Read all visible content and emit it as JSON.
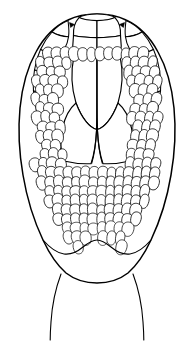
{
  "figure": {
    "title": "Ventral view of reptile head scalation",
    "caption": "",
    "view": "ventral",
    "subject": "reptile head",
    "style": "black ink line drawing",
    "background_color": "#ffffff",
    "line_color": "#000000",
    "fill_color": "#ffffff",
    "canvas": {
      "width": 194,
      "height": 354
    }
  },
  "chart_data": {
    "type": "diagram",
    "title": "Ventral view of reptile head scalation",
    "xlabel": "",
    "ylabel": "",
    "parts": [
      {
        "name": "rostral-scale",
        "label": "rostral",
        "count": 1
      },
      {
        "name": "mental-scale",
        "label": "mental",
        "count": 1
      },
      {
        "name": "postmental-scale",
        "label": "postmental",
        "count": 1
      },
      {
        "name": "chin-shield-anterior",
        "label": "anterior chin shields",
        "count": 2
      },
      {
        "name": "chin-shield-posterior",
        "label": "posterior chin shields",
        "count": 2
      },
      {
        "name": "infralabial-row-left",
        "label": "left infralabials",
        "count": 8
      },
      {
        "name": "infralabial-row-right",
        "label": "right infralabials",
        "count": 8
      },
      {
        "name": "eye-left",
        "label": "left eye",
        "count": 1
      },
      {
        "name": "eye-right",
        "label": "right eye",
        "count": 1
      },
      {
        "name": "gular-scales",
        "label": "gular scales",
        "count": 310
      },
      {
        "name": "neck-line-left",
        "label": "left neck fold",
        "count": 1
      },
      {
        "name": "neck-line-right",
        "label": "right neck fold",
        "count": 1
      }
    ],
    "legend": [],
    "annotations": []
  },
  "elements": {
    "head_outline_label": "head outline",
    "snout_label": "snout",
    "eye_left_label": "left eye",
    "eye_right_label": "right eye",
    "chin_label": "chin shields",
    "gular_label": "gular scale field",
    "neck_label": "neck"
  }
}
